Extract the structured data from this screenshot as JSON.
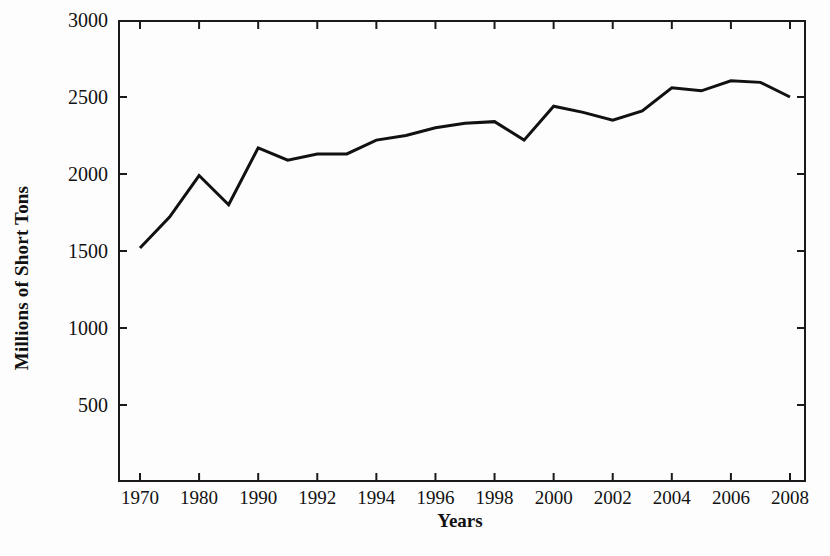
{
  "chart_data": {
    "type": "line",
    "title": "",
    "subtitle": "",
    "xlabel": "Years",
    "ylabel": "Millions of Short Tons",
    "ylim": [
      0,
      3000
    ],
    "ytick_values": [
      500,
      1000,
      1500,
      2000,
      2500,
      3000
    ],
    "ytick_labels": [
      "500",
      "1000",
      "1500",
      "2000",
      "2500",
      "3000"
    ],
    "xtick_labels": [
      "1970",
      "1980",
      "1990",
      "1992",
      "1994",
      "1996",
      "1998",
      "2000",
      "2002",
      "2004",
      "2006",
      "2008"
    ],
    "x_axis_note": "non-linear category axis: decade steps 1970-1990 then 2-year steps",
    "grid": false,
    "legend": false,
    "line_color": "#111111",
    "line_width": 3,
    "background_color": "#ffffff",
    "categories": [
      "1970",
      "1975",
      "1980",
      "1985",
      "1990",
      "1991",
      "1992",
      "1993",
      "1994",
      "1995",
      "1996",
      "1997",
      "1998",
      "1999",
      "2000",
      "2001",
      "2002",
      "2003",
      "2004",
      "2005",
      "2006",
      "2007",
      "2008"
    ],
    "values": [
      1520,
      1720,
      1990,
      1800,
      2170,
      2090,
      2130,
      2130,
      2220,
      2250,
      2300,
      2330,
      2340,
      2220,
      2440,
      2400,
      2350,
      2410,
      2560,
      2540,
      2605,
      2595,
      2500
    ],
    "series": [
      {
        "name": "Millions of Short Tons",
        "values": [
          1520,
          1720,
          1990,
          1800,
          2170,
          2090,
          2130,
          2130,
          2220,
          2250,
          2300,
          2330,
          2340,
          2220,
          2440,
          2400,
          2350,
          2410,
          2560,
          2540,
          2605,
          2595,
          2500
        ]
      }
    ],
    "annotations": []
  },
  "artifact": {
    "text": ""
  }
}
